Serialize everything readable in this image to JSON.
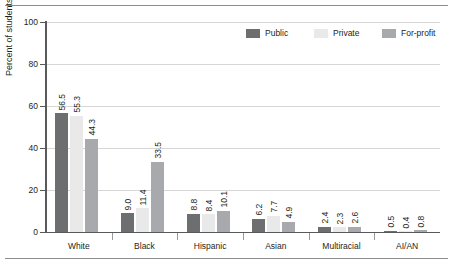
{
  "chart_data": {
    "type": "bar",
    "title": "",
    "xlabel": "",
    "ylabel": "Percent of students",
    "ylim": [
      0,
      100
    ],
    "yticks": [
      0,
      20,
      40,
      60,
      80,
      100
    ],
    "ytick_labels": [
      "0",
      "20",
      "40",
      "60",
      "80",
      "100"
    ],
    "grid": "horizontal",
    "legend_position": "top-right",
    "categories": [
      "White",
      "Black",
      "Hispanic",
      "Asian",
      "Multiracial",
      "AI/AN"
    ],
    "series": [
      {
        "name": "Public",
        "color": "#6d6e70",
        "values": [
          56.5,
          9.0,
          8.8,
          6.2,
          2.4,
          0.5
        ],
        "labels": [
          "56.5",
          "9.0",
          "8.8",
          "6.2",
          "2.4",
          "0.5"
        ]
      },
      {
        "name": "Private",
        "color": "#e9e9e9",
        "values": [
          55.3,
          11.4,
          8.4,
          7.7,
          2.3,
          0.4
        ],
        "labels": [
          "55.3",
          "11.4",
          "8.4",
          "7.7",
          "2.3",
          "0.4"
        ]
      },
      {
        "name": "For-profit",
        "color": "#a7a9ac",
        "values": [
          44.3,
          33.5,
          10.1,
          4.9,
          2.6,
          0.8
        ],
        "labels": [
          "44.3",
          "33.5",
          "10.1",
          "4.9",
          "2.6",
          "0.8"
        ]
      }
    ]
  },
  "legend": {
    "items": [
      {
        "label": "Public"
      },
      {
        "label": "Private"
      },
      {
        "label": "For-profit"
      }
    ]
  },
  "axes": {
    "y_title": "Percent of students",
    "y_tick_labels": [
      "100",
      "80",
      "60",
      "40",
      "20",
      "0"
    ],
    "x_tick_labels": [
      "White",
      "Black",
      "Hispanic",
      "Asian",
      "Multiracial",
      "AI/AN"
    ]
  }
}
